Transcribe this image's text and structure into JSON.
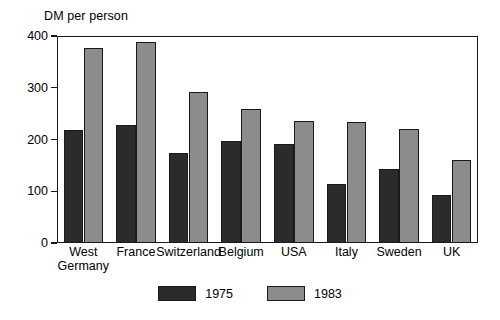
{
  "chart_data": {
    "type": "bar",
    "title": "",
    "ylabel": "DM per person",
    "xlabel": "",
    "ylim": [
      0,
      400
    ],
    "yticks": [
      0,
      100,
      200,
      300,
      400
    ],
    "ytick_labels": [
      "0",
      "100",
      "200",
      "300",
      "400"
    ],
    "grid": false,
    "legend_position": "bottom-center",
    "categories": [
      "West\nGermany",
      "France",
      "Switzerland",
      "Belgium",
      "USA",
      "Italy",
      "Sweden",
      "UK"
    ],
    "category_lines": [
      [
        "West",
        "Germany"
      ],
      [
        "France"
      ],
      [
        "Switzerland"
      ],
      [
        "Belgium"
      ],
      [
        "USA"
      ],
      [
        "Italy"
      ],
      [
        "Sweden"
      ],
      [
        "UK"
      ]
    ],
    "series": [
      {
        "name": "1975",
        "color": "#2b2b2b",
        "values": [
          218,
          228,
          173,
          198,
          191,
          114,
          143,
          93
        ]
      },
      {
        "name": "1983",
        "color": "#8c8c8c",
        "values": [
          376,
          389,
          292,
          259,
          235,
          233,
          221,
          161
        ]
      }
    ]
  },
  "legend": {
    "items": [
      {
        "label": "1975",
        "color": "#2b2b2b"
      },
      {
        "label": "1983",
        "color": "#8c8c8c"
      }
    ]
  },
  "colors": {
    "series_1975": "#2b2b2b",
    "series_1983": "#8c8c8c",
    "axis": "#1a1a1a",
    "background": "#ffffff"
  }
}
